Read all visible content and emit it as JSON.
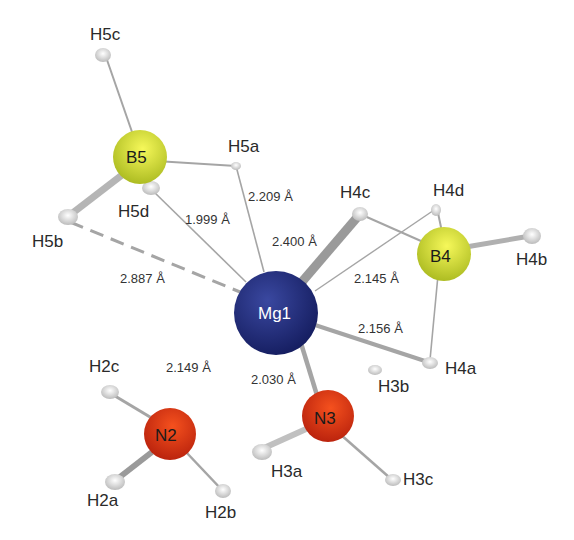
{
  "figure": {
    "type": "molecular-structure",
    "center_atom": "Mg1",
    "colors": {
      "Mg": "#1f2a78",
      "B": "#e4ea3a",
      "N": "#e8391a",
      "H": "#e6e6e6",
      "bond": "#a8a8a8"
    }
  },
  "atoms": {
    "Mg1": "Mg1",
    "B4": "B4",
    "B5": "B5",
    "N2": "N2",
    "N3": "N3",
    "H5c": "H5c",
    "H5a": "H5a",
    "H5d": "H5d",
    "H5b": "H5b",
    "H4c": "H4c",
    "H4d": "H4d",
    "H4b": "H4b",
    "H4a": "H4a",
    "H3b": "H3b",
    "H3a": "H3a",
    "H3c": "H3c",
    "H2c": "H2c",
    "H2a": "H2a",
    "H2b": "H2b"
  },
  "distances": {
    "mg_h5a": "2.209 Å",
    "mg_h5d": "1.999 Å",
    "mg_h4c": "2.400 Å",
    "mg_h4d": "2.145 Å",
    "mg_h5b": "2.887 Å",
    "mg_h4a": "2.156 Å",
    "mg_n2": "2.149 Å",
    "mg_n3": "2.030 Å"
  }
}
